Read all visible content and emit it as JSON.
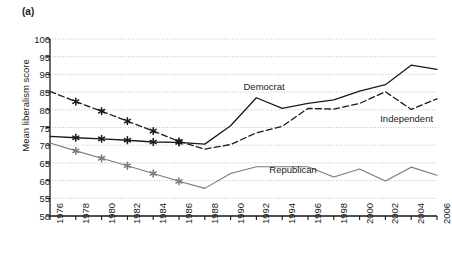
{
  "panel": {
    "label": "(a)"
  },
  "chart_data": {
    "type": "line",
    "title": "",
    "xlabel": "",
    "ylabel": "Mean liberalism score",
    "xlim": [
      1976,
      2006
    ],
    "ylim": [
      50,
      100
    ],
    "ytick_step": 5,
    "xtick_step": 2,
    "grid": true,
    "legend_position": "inline-annotations",
    "categories": [
      1976,
      1978,
      1980,
      1982,
      1984,
      1986,
      1988,
      1990,
      1992,
      1994,
      1996,
      1998,
      2000,
      2002,
      2004,
      2006
    ],
    "xtick_labels": [
      "1976",
      "1978",
      "1980",
      "1982",
      "1984",
      "1986",
      "1988",
      "1990",
      "1992",
      "1994",
      "1996",
      "1998",
      "2000",
      "2002",
      "2004",
      "2006"
    ],
    "ytick_labels": [
      "50",
      "55",
      "60",
      "65",
      "70",
      "75",
      "80",
      "85",
      "90",
      "95",
      "100"
    ],
    "series": [
      {
        "name": "Democrat",
        "style": "solid",
        "color": "#1a1a1a",
        "markers": "asterisk-through-1986",
        "values": [
          72.5,
          72.1,
          71.8,
          71.4,
          70.9,
          70.8,
          70.3,
          75.5,
          83.4,
          80.4,
          81.8,
          82.8,
          85.3,
          87.1,
          92.6,
          91.4
        ]
      },
      {
        "name": "Independent",
        "style": "dashed",
        "color": "#1a1a1a",
        "markers": "asterisk-through-1986",
        "values": [
          85.2,
          82.3,
          79.6,
          76.8,
          74.0,
          71.1,
          68.9,
          70.2,
          73.5,
          75.3,
          80.4,
          80.2,
          81.8,
          85.1,
          80.1,
          83.1
        ]
      },
      {
        "name": "Republican",
        "style": "solid",
        "color": "#7a7a76",
        "markers": "asterisk-through-1986",
        "values": [
          70.6,
          68.4,
          66.3,
          64.2,
          62.0,
          59.8,
          57.8,
          62.0,
          63.9,
          63.9,
          63.9,
          61.0,
          63.3,
          59.9,
          63.8,
          61.5
        ]
      }
    ],
    "annotations": [
      {
        "text": "Democrat",
        "x": 1991.0,
        "y": 86.5
      },
      {
        "text": "Independent",
        "x": 2001.6,
        "y": 77.5
      },
      {
        "text": "Republican",
        "x": 1993.0,
        "y": 63.0
      }
    ]
  }
}
